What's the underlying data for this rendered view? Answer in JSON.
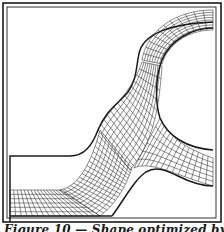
{
  "figure": {
    "caption": "Figure 10 — Shape optimized by finite",
    "colors": {
      "line": "#1a1a1a",
      "mesh": "#2a2a2a",
      "background": "#ffffff"
    },
    "frame": {
      "outer": [
        3,
        3,
        221,
        225
      ],
      "inner": [
        7,
        7,
        217,
        222
      ]
    },
    "regions": [
      {
        "name": "upper-right-arc-mesh",
        "rows": 8,
        "cols": 10
      },
      {
        "name": "s-curve-transition-mesh",
        "rows": 12,
        "cols": 22
      },
      {
        "name": "lower-left-channel-mesh",
        "rows": 6,
        "cols": 16
      },
      {
        "name": "right-tab-mesh",
        "rows": 5,
        "cols": 8
      }
    ]
  }
}
